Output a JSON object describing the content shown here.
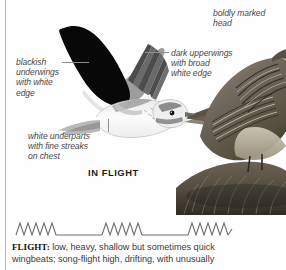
{
  "plate": {
    "annotations": [
      {
        "id": "boldly-marked-head",
        "text": "boldly marked\nhead"
      },
      {
        "id": "dark-upperwings",
        "text": "dark upperwings\nwith broad\nwhite edge"
      },
      {
        "id": "blackish-underwings",
        "text": "blackish\nunderwings\nwith white\nedge"
      },
      {
        "id": "white-underparts",
        "text": "white underparts\nwith fine streaks\non chest"
      }
    ],
    "in_flight_label": "IN FLIGHT",
    "bird_in_flight_alt": "lark in flight, black underwing raised, white underparts",
    "bird_perched_alt": "streaked brown lark perched on grassy tussock"
  },
  "flight_pattern": {
    "label": "flight action diagram",
    "bursts": 3,
    "zigzags_per_burst": 6
  },
  "caption": {
    "heading": "FLIGHT:",
    "line1": " low, heavy, shallow but sometimes quick",
    "line2": "wingbeats; song-flight high, drifting, with unusually"
  },
  "colors": {
    "ink": "#3a3a3a",
    "label": "#4a4a4a",
    "leader": "#8e8e8e",
    "rule": "#b8b8b8",
    "page": "#fefefe"
  }
}
